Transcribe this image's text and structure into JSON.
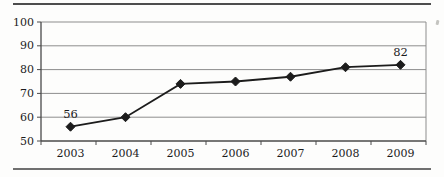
{
  "figure": {
    "background": "#fdfdfc",
    "top_rule_color": "#4d4d4d",
    "bottom_rule_color": "#707070"
  },
  "chart_data": {
    "type": "line",
    "title": "",
    "subtitle": "",
    "xlabel": "",
    "ylabel": "",
    "categories": [
      "2003",
      "2004",
      "2005",
      "2006",
      "2007",
      "2008",
      "2009"
    ],
    "series": [
      {
        "name": "series-1",
        "values": [
          56,
          60,
          74,
          75,
          77,
          81,
          82
        ]
      }
    ],
    "point_labels": [
      {
        "index": 0,
        "text": "56"
      },
      {
        "index": 6,
        "text": "82"
      }
    ],
    "ylim": [
      50,
      100
    ],
    "yticks": [
      50,
      60,
      70,
      80,
      90,
      100
    ],
    "grid": "horizontal-only",
    "legend": "none",
    "marker": "diamond",
    "colors": {
      "line": "#1c1c1c",
      "marker": "#1c1c1c",
      "grid": "#8d8d8d",
      "plot_border": "#8d8d8d",
      "axis": "#4a4a4a",
      "text": "#1c1c1c"
    }
  }
}
